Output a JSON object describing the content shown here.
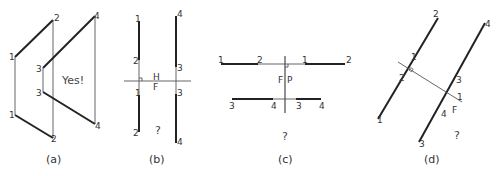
{
  "figure": {
    "panels": [
      {
        "id": "a",
        "caption": "(a)",
        "annotation": "Yes!",
        "point_labels": {
          "p1_top": "1",
          "p2_top": "2",
          "p1_bot": "1",
          "p2_bot": "2",
          "p3_top": "3",
          "p4_top": "4",
          "p3_bot": "3",
          "p4_bot": "4"
        }
      },
      {
        "id": "b",
        "caption": "(b)",
        "annotation": "?",
        "fold_labels": {
          "upper": "H",
          "lower": "F"
        },
        "point_labels": {
          "p1_top": "1",
          "p2_top": "2",
          "p1_bot": "1",
          "p2_bot": "2",
          "p4_top": "4",
          "p3_top": "3",
          "p3_bot": "3",
          "p4_bot": "4"
        }
      },
      {
        "id": "c",
        "caption": "(c)",
        "annotation": "?",
        "fold_labels": {
          "left": "F",
          "right": "P"
        },
        "point_labels": {
          "p1_left": "1",
          "p2_left": "2",
          "p1_right": "1",
          "p2_right": "2",
          "p3_left": "3",
          "p4_left": "4",
          "p3_right": "3",
          "p4_right": "4"
        }
      },
      {
        "id": "d",
        "caption": "(d)",
        "annotation": "?",
        "fold_labels": {
          "upper": "1",
          "lower": "F"
        },
        "point_labels": {
          "p2_top": "2",
          "p1_upper": "1",
          "p2_lower": "2",
          "p1_bot": "1",
          "p4_top": "4",
          "p3_upper": "3",
          "p4_lower": "4",
          "p3_bot": "3"
        }
      }
    ]
  }
}
